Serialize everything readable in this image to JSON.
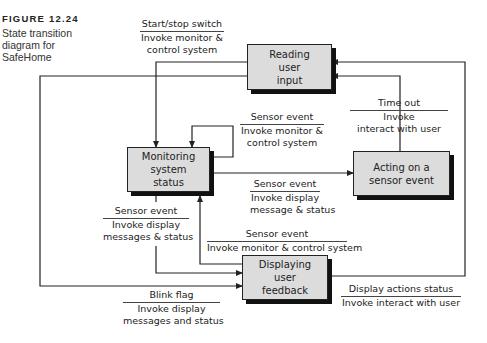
{
  "caption": {
    "figure_number": "FIGURE 12.24",
    "lines": [
      "State transition",
      "diagram for",
      "SafeHome"
    ]
  },
  "states": {
    "reading": {
      "lines": [
        "Reading",
        "user",
        "input"
      ]
    },
    "monitoring": {
      "lines": [
        "Monitoring",
        "system",
        "status"
      ]
    },
    "acting": {
      "lines": [
        "Acting on a",
        "sensor event"
      ]
    },
    "displaying": {
      "lines": [
        "Displaying",
        "user",
        "feedback"
      ]
    }
  },
  "transitions": {
    "start_stop": {
      "event": "Start/stop switch",
      "action_lines": [
        "Invoke monitor &",
        "control system"
      ]
    },
    "time_out": {
      "event": "Time out",
      "action_lines": [
        "Invoke",
        "interact with user"
      ]
    },
    "monitor_self": {
      "event": "Sensor event",
      "action_lines": [
        "Invoke monitor &",
        "control system"
      ]
    },
    "monitor_to_acting": {
      "event": "Sensor event",
      "action_lines": [
        "Invoke display",
        "message & status"
      ]
    },
    "monitor_to_display": {
      "event": "Sensor event",
      "action_lines": [
        "Invoke display",
        "messages & status"
      ]
    },
    "display_to_monitor": {
      "event": "Sensor event",
      "action_lines": [
        "Invoke monitor & control system"
      ]
    },
    "blink_flag": {
      "event": "Blink flag",
      "action_lines": [
        "Invoke display",
        "messages and status"
      ]
    },
    "display_actions": {
      "event": "Display actions status",
      "action_lines": [
        "Invoke interact with user"
      ]
    }
  },
  "colors": {
    "box_fill": "#dcdcdc",
    "line": "#222222",
    "shadow": "#111111"
  }
}
